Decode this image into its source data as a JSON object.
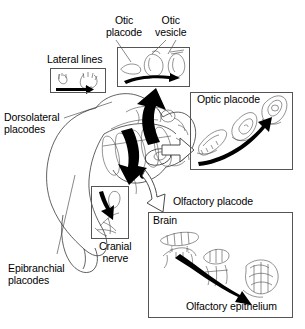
{
  "figure": {
    "background_color": "#ffffff",
    "ink_color": "#000000",
    "line_color": "#555555"
  },
  "labels": {
    "otic_placode": "Otic\nplacode",
    "otic_vesicle": "Otic\nvesicle",
    "lateral_lines": "Lateral lines",
    "dorsolateral_placodes": "Dorsolateral\nplacodes",
    "epibranchial_placodes": "Epibranchial\nplacodes",
    "cranial_nerve": "Cranial\nnerve",
    "optic_placode": "Optic placode",
    "olfactory_placode": "Olfactory placode",
    "brain": "Brain",
    "olfactory_epithelium": "Olfactory epithelium"
  },
  "panels": [
    {
      "id": "lateral-lines",
      "label": "Lateral lines",
      "label_position": "above",
      "x": 50,
      "y": 68,
      "w": 56,
      "h": 25,
      "arrow": "black-arrow-right",
      "stages": 2
    },
    {
      "id": "otic",
      "labels": [
        "Otic placode",
        "Otic vesicle"
      ],
      "label_position": "above",
      "x": 117,
      "y": 47,
      "w": 73,
      "h": 40,
      "arrow": "black-arrow-right-curved",
      "stages": 3
    },
    {
      "id": "optic",
      "label": "Optic placode",
      "label_position": "inside-top-left",
      "x": 190,
      "y": 92,
      "w": 103,
      "h": 78,
      "arrow": "black-arrow-up-right-curved",
      "stages": 3
    },
    {
      "id": "cranial-nerve",
      "label": "Cranial nerve",
      "label_position": "below-right",
      "x": 91,
      "y": 186,
      "w": 38,
      "h": 53,
      "arrow": "black-arrow-down",
      "stages": 1
    },
    {
      "id": "olfactory",
      "label": "Olfactory placode",
      "label_position": "above",
      "inner_labels": [
        "Brain",
        "Olfactory epithelium"
      ],
      "x": 148,
      "y": 212,
      "w": 145,
      "h": 106,
      "arrow": "black-arrow-down-right-curved",
      "stages": 3
    }
  ],
  "connectors": [
    {
      "id": "to-otic",
      "style": "solid-black",
      "from": "embryo-dorsal",
      "to": "otic-panel",
      "direction": "up"
    },
    {
      "id": "to-cranial-nerve",
      "style": "solid-black",
      "from": "embryo-pharyngeal",
      "to": "cranial-nerve-panel",
      "direction": "down"
    },
    {
      "id": "to-optic",
      "style": "hollow-white",
      "from": "embryo-eye",
      "to": "optic-panel",
      "direction": "right"
    },
    {
      "id": "to-olfactory",
      "style": "hollow-white",
      "from": "embryo-nasal",
      "to": "olfactory-panel",
      "direction": "down-right"
    }
  ],
  "leaders": [
    {
      "id": "dorsolateral-leader",
      "from_label": "Dorsolateral placodes",
      "to": "embryo-dorsolateral-region"
    },
    {
      "id": "epibranchial-leader",
      "from_label": "Epibranchial placodes",
      "to": "embryo-epibranchial-region"
    },
    {
      "id": "otic-placode-leader",
      "from_label": "Otic placode",
      "to": "otic-panel-stage-1"
    },
    {
      "id": "otic-vesicle-leader",
      "from_label": "Otic vesicle",
      "to": "otic-panel-stage-2"
    }
  ]
}
